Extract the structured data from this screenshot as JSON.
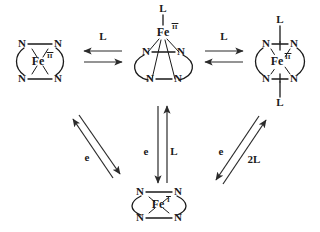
{
  "diagram": {
    "background_color": "#ffffff",
    "ink_color": "#1a1a1a",
    "arrow_color": "#2b2b2b"
  },
  "species": {
    "four_coordinate": {
      "id": "fe2-four-coordinate",
      "metal": "Fe",
      "oxidation_state": "II",
      "donors": [
        "N",
        "N",
        "N",
        "N"
      ],
      "axial_ligands": [],
      "geometry": "square-planar"
    },
    "five_coordinate": {
      "id": "fe2-five-coordinate",
      "metal": "Fe",
      "oxidation_state": "II",
      "donors": [
        "N",
        "N",
        "N",
        "N"
      ],
      "axial_ligands": [
        "L"
      ],
      "geometry": "square-pyramidal"
    },
    "six_coordinate": {
      "id": "fe2-six-coordinate",
      "metal": "Fe",
      "oxidation_state": "II",
      "donors": [
        "N",
        "N",
        "N",
        "N"
      ],
      "axial_ligands": [
        "L",
        "L"
      ],
      "geometry": "octahedral"
    },
    "reduced": {
      "id": "fe1-four-coordinate",
      "metal": "Fe",
      "oxidation_state": "I",
      "donors": [
        "N",
        "N",
        "N",
        "N"
      ],
      "axial_ligands": [],
      "geometry": "square-planar"
    }
  },
  "arrows": {
    "left_pair": {
      "label": "L",
      "from": "fe2-four-coordinate",
      "to": "fe2-five-coordinate",
      "type": "equilibrium"
    },
    "right_pair": {
      "label": "L",
      "from": "fe2-five-coordinate",
      "to": "fe2-six-coordinate",
      "type": "equilibrium"
    },
    "left_diagonal": {
      "label": "e",
      "from": "fe2-four-coordinate",
      "to": "fe1-four-coordinate",
      "type": "equilibrium"
    },
    "center_down": {
      "label": "e",
      "from": "fe2-five-coordinate",
      "to": "fe1-four-coordinate",
      "type": "single"
    },
    "center_up": {
      "label": "L",
      "from": "fe1-four-coordinate",
      "to": "fe2-five-coordinate",
      "type": "single"
    },
    "right_diagonal_e": {
      "label": "e",
      "from": "fe2-six-coordinate",
      "to": "fe1-four-coordinate",
      "type": "single"
    },
    "right_diagonal_2l": {
      "label": "2L",
      "from": "fe1-four-coordinate",
      "to": "fe2-six-coordinate",
      "type": "single"
    }
  }
}
